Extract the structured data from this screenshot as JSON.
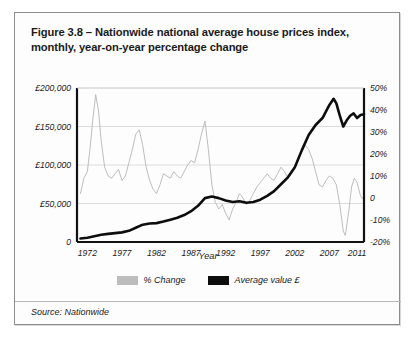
{
  "figure": {
    "title": "Figure 3.8 – Nationwide national average house prices index, monthly, year-on-year percentage change",
    "source": "Source: Nationwide"
  },
  "legend": {
    "items": [
      {
        "label": "% Change",
        "color": "#bdbdbd"
      },
      {
        "label": "Average value £",
        "color": "#0d0d0d"
      }
    ]
  },
  "chart_data": {
    "type": "line",
    "title": "Figure 3.8 – Nationwide national average house prices index, monthly, year-on-year percentage change",
    "xlabel": "Year",
    "ylabel": "",
    "grid": true,
    "legend_position": "bottom",
    "x_ticks": [
      "1972",
      "1977",
      "1982",
      "1987",
      "1992",
      "1997",
      "2002",
      "2007",
      "2011"
    ],
    "x_tick_values": [
      1972,
      1977,
      1982,
      1987,
      1992,
      1997,
      2002,
      2007,
      2011
    ],
    "xlim": [
      1970.5,
      2012.0
    ],
    "left_axis": {
      "label": "Average value £",
      "ticks": [
        "0",
        "£50,000",
        "£100,000",
        "£150,000",
        "£200,000"
      ],
      "tick_values": [
        0,
        50000,
        100000,
        150000,
        200000
      ],
      "ylim": [
        0,
        200000
      ]
    },
    "right_axis": {
      "label": "% Change",
      "ticks": [
        "-20%",
        "-10%",
        "0",
        "10%",
        "20%",
        "30%",
        "40%",
        "50%"
      ],
      "tick_values": [
        -20,
        -10,
        0,
        10,
        20,
        30,
        40,
        50
      ],
      "ylim": [
        -20,
        50
      ]
    },
    "series": [
      {
        "name": "% Change",
        "axis": "right",
        "color": "#bdbdbd",
        "unit": "%",
        "x": [
          1971.0,
          1971.5,
          1972.0,
          1972.4,
          1972.8,
          1973.2,
          1973.6,
          1974.0,
          1974.5,
          1975.0,
          1975.5,
          1976.0,
          1976.5,
          1977.0,
          1977.5,
          1978.0,
          1978.5,
          1979.0,
          1979.5,
          1980.0,
          1980.5,
          1981.0,
          1981.5,
          1982.0,
          1982.5,
          1983.0,
          1983.5,
          1984.0,
          1984.5,
          1985.0,
          1985.5,
          1986.0,
          1986.5,
          1987.0,
          1987.5,
          1988.0,
          1988.5,
          1989.0,
          1989.5,
          1990.0,
          1990.5,
          1991.0,
          1991.5,
          1992.0,
          1992.5,
          1993.0,
          1993.5,
          1994.0,
          1994.5,
          1995.0,
          1995.5,
          1996.0,
          1996.5,
          1997.0,
          1997.5,
          1998.0,
          1998.5,
          1999.0,
          1999.5,
          2000.0,
          2000.5,
          2001.0,
          2001.5,
          2002.0,
          2002.5,
          2003.0,
          2003.5,
          2004.0,
          2004.5,
          2005.0,
          2005.5,
          2006.0,
          2006.5,
          2007.0,
          2007.5,
          2008.0,
          2008.5,
          2009.0,
          2009.3,
          2009.8,
          2010.2,
          2010.6,
          2011.0,
          2011.5,
          2012.0
        ],
        "values": [
          2,
          9,
          12,
          23,
          36,
          47,
          40,
          26,
          14,
          10,
          9,
          11,
          13,
          8,
          10,
          16,
          22,
          29,
          31,
          24,
          14,
          8,
          4,
          2,
          6,
          11,
          10,
          9,
          12,
          10,
          9,
          12,
          15,
          17,
          16,
          22,
          29,
          35,
          22,
          6,
          -2,
          -5,
          -3,
          -7,
          -10,
          -5,
          -2,
          2,
          0,
          -3,
          -1,
          2,
          5,
          7,
          9,
          11,
          9,
          8,
          11,
          14,
          12,
          9,
          11,
          14,
          18,
          21,
          24,
          22,
          18,
          12,
          6,
          5,
          8,
          10,
          9,
          6,
          -3,
          -15,
          -17,
          -6,
          5,
          9,
          7,
          1,
          -1
        ]
      },
      {
        "name": "Average value £",
        "axis": "left",
        "color": "#0d0d0d",
        "unit": "£",
        "x": [
          1971.0,
          1972.0,
          1973.0,
          1974.0,
          1975.0,
          1976.0,
          1977.0,
          1978.0,
          1979.0,
          1980.0,
          1981.0,
          1982.0,
          1983.0,
          1984.0,
          1985.0,
          1986.0,
          1987.0,
          1988.0,
          1989.0,
          1990.0,
          1991.0,
          1992.0,
          1993.0,
          1994.0,
          1995.0,
          1996.0,
          1997.0,
          1998.0,
          1999.0,
          2000.0,
          2001.0,
          2002.0,
          2003.0,
          2004.0,
          2005.0,
          2006.0,
          2007.0,
          2007.6,
          2008.0,
          2008.5,
          2009.0,
          2009.5,
          2010.0,
          2010.5,
          2011.0,
          2011.5,
          2012.0
        ],
        "values": [
          4500,
          5500,
          7500,
          9500,
          10500,
          11500,
          12500,
          14500,
          18500,
          22500,
          24000,
          24500,
          26500,
          29000,
          31500,
          35000,
          40000,
          47000,
          57000,
          59000,
          57000,
          54000,
          52000,
          53000,
          51000,
          52000,
          55000,
          60000,
          66000,
          75000,
          84000,
          97000,
          119000,
          139000,
          152000,
          161000,
          178000,
          186000,
          180000,
          164000,
          150000,
          158000,
          164000,
          167000,
          161000,
          165000,
          166000
        ]
      }
    ]
  }
}
